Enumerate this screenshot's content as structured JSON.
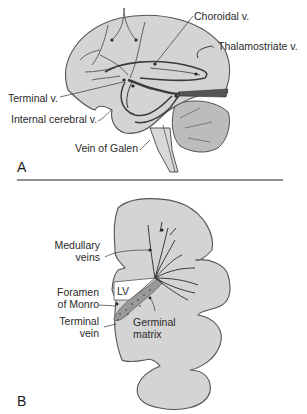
{
  "figure": {
    "panel_a": {
      "letter": "A",
      "labels": {
        "choroidal": "Choroidal v.",
        "thalamostriate": "Thalamostriate v.",
        "terminal": "Terminal v.",
        "internal_cerebral": "Internal cerebral v.",
        "galen": "Vein of Galen"
      }
    },
    "panel_b": {
      "letter": "B",
      "labels": {
        "medullary_1": "Medullary",
        "medullary_2": "veins",
        "lv": "LV",
        "foramen_1": "Foramen",
        "foramen_2": "of Monro",
        "terminal_1": "Terminal",
        "terminal_2": "vein",
        "germinal_1": "Germinal",
        "germinal_2": "matrix"
      }
    },
    "colors": {
      "brain_fill": "#d4d4d4",
      "cerebellum_fill": "#bcbcbc",
      "outline": "#555555",
      "vein": "#3a3a3a",
      "background": "#ffffff"
    }
  }
}
